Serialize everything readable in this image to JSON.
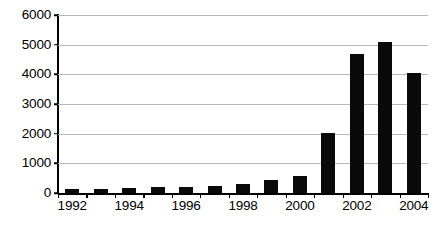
{
  "chart_data": {
    "type": "bar",
    "title": "",
    "subtitle": "",
    "xlabel": "",
    "ylabel": "",
    "categories": [
      "1992",
      "1993",
      "1994",
      "1995",
      "1996",
      "1997",
      "1998",
      "1999",
      "2000",
      "2001",
      "2002",
      "2003",
      "2004"
    ],
    "values": [
      150,
      150,
      175,
      190,
      210,
      250,
      300,
      450,
      570,
      2030,
      4700,
      5100,
      4030
    ],
    "series": [
      {
        "name": "",
        "values": [
          150,
          150,
          175,
          190,
          210,
          250,
          300,
          450,
          570,
          2030,
          4700,
          5100,
          4030
        ]
      }
    ],
    "ylim": [
      0,
      6000
    ],
    "y_ticks": [
      0,
      1000,
      2000,
      3000,
      4000,
      5000,
      6000
    ],
    "y_tick_labels": [
      "0",
      "1000",
      "2000",
      "3000",
      "4000",
      "5000",
      "6000"
    ],
    "x_tick_labels_shown": [
      "1992",
      "1994",
      "1996",
      "1998",
      "2000",
      "2002",
      "2004"
    ],
    "x_tick_label_indices": [
      0,
      2,
      4,
      6,
      8,
      10,
      12
    ],
    "grid": true,
    "grid_axis": "y",
    "legend": false,
    "legend_position": "none",
    "bar_color": "#0a0a0a",
    "gridline_color": "#b9b9b9",
    "axis_color": "#000000",
    "background_color": "#ffffff"
  }
}
